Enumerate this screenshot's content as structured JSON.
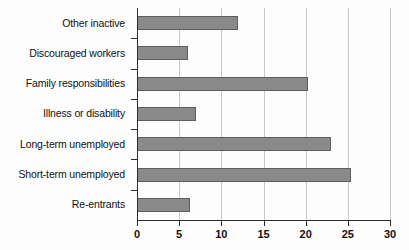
{
  "chart_data": {
    "type": "bar",
    "orientation": "horizontal",
    "title": "",
    "subtitle": "",
    "xlabel": "",
    "ylabel": "",
    "categories": [
      "Other inactive",
      "Discouraged workers",
      "Family responsibilities",
      "Illness or disability",
      "Long-term unemployed",
      "Short-term unemployed",
      "Re-entrants"
    ],
    "values": [
      12,
      6,
      20.3,
      7,
      23,
      25.4,
      6.3
    ],
    "xlim": [
      0,
      30
    ],
    "xticks": [
      0,
      5,
      10,
      15,
      20,
      25,
      30
    ],
    "xtick_labels": [
      "0",
      "5",
      "10",
      "15",
      "20",
      "25",
      "30"
    ],
    "grid": true,
    "grid_axis": "x",
    "legend": false,
    "legend_position": "none",
    "bar_color": "#8a8a8a",
    "bar_edge_color": "#5e5e5e",
    "axis_color": "#2b2b2b",
    "gridline_color": "#c9c9c9",
    "background_color": "#fdfdfd"
  }
}
